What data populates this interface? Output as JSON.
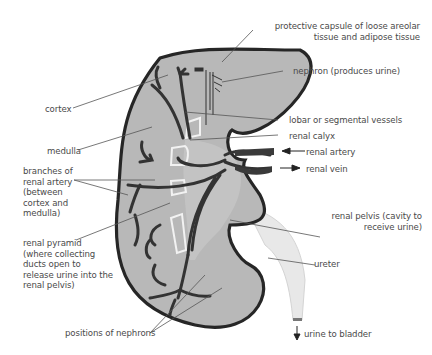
{
  "diagram": {
    "type": "anatomical-cross-section",
    "colors": {
      "kidney_fill": "#b7b7b7",
      "kidney_outline": "#2b2b2b",
      "vessels": "#3a3a3a",
      "calyx_outline": "#f2f2f2",
      "ureter_fill": "#e6e6e6",
      "leader_lines": "#555555",
      "label_text": "#4a4a4a"
    }
  },
  "labels": {
    "capsule": {
      "line1": "protective capsule of loose areolar",
      "line2": "tissue and adipose tissue"
    },
    "nephron": "nephron (produces urine)",
    "cortex": "cortex",
    "lobar_vessels": "lobar or segmental vessels",
    "medulla": "medulla",
    "renal_calyx": "renal calyx",
    "renal_artery": "renal artery",
    "renal_vein": "renal vein",
    "branches": {
      "line1": "branches of",
      "line2": "renal artery",
      "line3": "(between",
      "line4": "cortex and",
      "line5": "medulla)"
    },
    "renal_pelvis": {
      "line1": "renal pelvis (cavity to",
      "line2": "receive urine)"
    },
    "renal_pyramid": {
      "line1": "renal pyramid",
      "line2": "(where collecting",
      "line3": "ducts open to",
      "line4": "release urine into the",
      "line5": "renal pelvis)"
    },
    "ureter": "ureter",
    "positions_nephrons": "positions of nephrons",
    "urine_to_bladder": "urine to bladder"
  }
}
